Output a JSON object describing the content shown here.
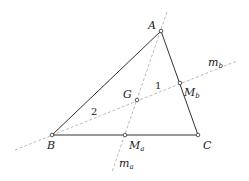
{
  "diagram": {
    "type": "triangle-medians-centroid",
    "points": {
      "A": {
        "label": "A",
        "x": 161,
        "y": 31
      },
      "B": {
        "label": "B",
        "x": 52,
        "y": 135
      },
      "C": {
        "label": "C",
        "x": 198,
        "y": 135
      },
      "Ma": {
        "label": "M",
        "sub": "a",
        "x": 125,
        "y": 135
      },
      "Mb": {
        "label": "M",
        "sub": "b",
        "x": 180,
        "y": 83
      },
      "G": {
        "label": "G",
        "x": 137,
        "y": 100
      }
    },
    "lines": {
      "ma": {
        "label": "m",
        "sub": "a"
      },
      "mb": {
        "label": "m",
        "sub": "b"
      }
    },
    "ratio_labels": {
      "bg": "2",
      "gmb": "1"
    },
    "colors": {
      "stroke": "#333333",
      "dashed": "#999999"
    }
  }
}
